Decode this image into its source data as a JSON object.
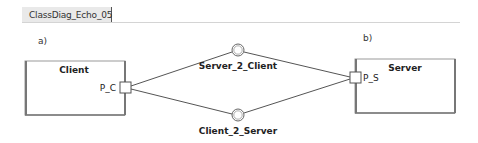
{
  "tab": {
    "label": "ClassDiag_Echo_05",
    "icon": "class-diagram-icon"
  },
  "diagram": {
    "label_a": "a)",
    "label_b": "b)",
    "client": {
      "name": "Client",
      "port": "P_C"
    },
    "server": {
      "name": "Server",
      "port": "P_S"
    },
    "interfaces": [
      {
        "name": "Server_2_Client"
      },
      {
        "name": "Client_2_Server"
      }
    ],
    "colors": {
      "line": "#555555",
      "box_border": "#777777",
      "box_shadow": "#888888",
      "background": "#ffffff"
    }
  }
}
